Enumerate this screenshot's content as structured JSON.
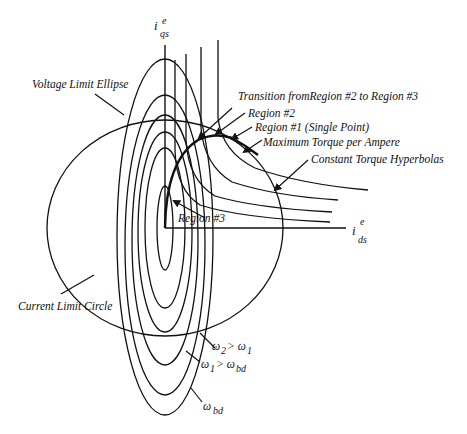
{
  "diagram": {
    "axes": {
      "vertical": {
        "symbol": "i",
        "subscript": "qs",
        "superscript": "e"
      },
      "horizontal": {
        "symbol": "i",
        "subscript": "ds",
        "superscript": "e"
      }
    },
    "labels": {
      "voltage_limit_ellipse": "Voltage Limit Ellipse",
      "transition": "Transition fromRegion #2 to Region #3",
      "region2": "Region #2",
      "region1": "Region #1 (Single Point)",
      "mtpa": "Maximum Torque per Ampere",
      "hyperbolas": "Constant Torque Hyperbolas",
      "region3": "Region #3",
      "current_limit_circle": "Current Limit Circle"
    },
    "speed_labels": {
      "w2": {
        "base": "ω",
        "sub": "2",
        "rel": "> ω",
        "sub2": "1"
      },
      "w1": {
        "base": "ω",
        "sub": "1",
        "rel": "> ω",
        "sub2": "bd"
      },
      "wbd": {
        "base": "ω",
        "sub": "bd"
      }
    },
    "ellipse_count": 6,
    "hyperbola_count": 4
  }
}
